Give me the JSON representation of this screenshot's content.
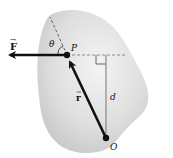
{
  "diagram": {
    "type": "torque-moment-arm",
    "labels": {
      "force": "F",
      "angle": "θ",
      "point_p": "P",
      "position": "r",
      "distance": "d",
      "origin": "O"
    },
    "vector_arrow": "→",
    "colors": {
      "body_fill_light": "#f2f2f2",
      "body_fill_dark": "#c8c8c8",
      "vector": "#111111",
      "dashed": "#888888",
      "line": "#777777"
    }
  }
}
